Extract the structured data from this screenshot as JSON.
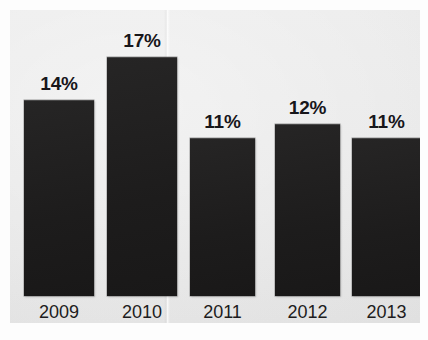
{
  "chart_data": {
    "type": "bar",
    "title": "",
    "subtitle": "",
    "xlabel": "",
    "ylabel": "",
    "categories": [
      "2009",
      "2010",
      "2011",
      "2012",
      "2013"
    ],
    "values": [
      14,
      17,
      11,
      12,
      11
    ],
    "value_labels": [
      "14%",
      "17%",
      "11%",
      "12%",
      "11%"
    ],
    "value_unit": "%",
    "ylim": [
      0,
      18
    ],
    "grid": false,
    "legend": false,
    "legend_position": "none",
    "series": [
      {
        "name": "",
        "values": [
          14,
          17,
          11,
          12,
          11
        ]
      }
    ],
    "annotations": []
  },
  "colors": {
    "bar": "#201f1f",
    "panel_background": "#e9e9e9",
    "page_background": "#fdfdfd",
    "label_text": "#17161a",
    "category_text": "#1d1c20"
  }
}
